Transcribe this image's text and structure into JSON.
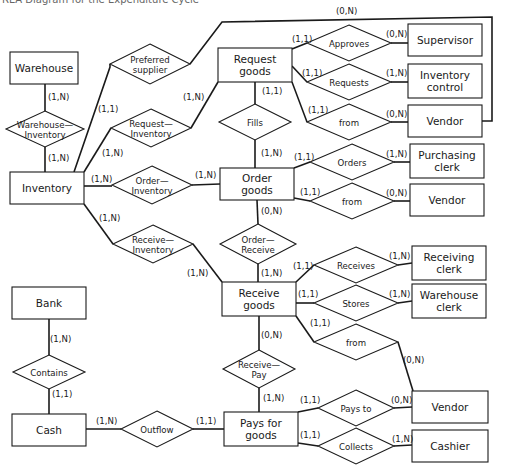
{
  "caption": "REA Diagram for the Expenditure Cycle",
  "colors": {
    "line": "#1a1a1a",
    "fill": "#ffffff",
    "background": "#ffffff"
  },
  "entities": [
    {
      "id": "warehouse",
      "label": [
        "Warehouse"
      ],
      "x": 10,
      "y": 52,
      "w": 68,
      "h": 32
    },
    {
      "id": "inventory",
      "label": [
        "Inventory"
      ],
      "x": 10,
      "y": 172,
      "w": 74,
      "h": 32
    },
    {
      "id": "request_goods",
      "label": [
        "Request",
        "goods"
      ],
      "x": 218,
      "y": 48,
      "w": 74,
      "h": 34
    },
    {
      "id": "supervisor",
      "label": [
        "Supervisor"
      ],
      "x": 408,
      "y": 24,
      "w": 74,
      "h": 32
    },
    {
      "id": "inventory_control",
      "label": [
        "Inventory",
        "control"
      ],
      "x": 408,
      "y": 64,
      "w": 74,
      "h": 34
    },
    {
      "id": "vendor_1",
      "label": [
        "Vendor"
      ],
      "x": 408,
      "y": 105,
      "w": 74,
      "h": 32
    },
    {
      "id": "order_goods",
      "label": [
        "Order",
        "goods"
      ],
      "x": 220,
      "y": 168,
      "w": 74,
      "h": 32
    },
    {
      "id": "purchasing_clerk",
      "label": [
        "Purchasing",
        "clerk"
      ],
      "x": 410,
      "y": 144,
      "w": 74,
      "h": 34
    },
    {
      "id": "vendor_2",
      "label": [
        "Vendor"
      ],
      "x": 410,
      "y": 184,
      "w": 74,
      "h": 32
    },
    {
      "id": "receive_goods",
      "label": [
        "Receive",
        "goods"
      ],
      "x": 222,
      "y": 282,
      "w": 74,
      "h": 34
    },
    {
      "id": "receiving_clerk",
      "label": [
        "Receiving",
        "clerk"
      ],
      "x": 412,
      "y": 246,
      "w": 74,
      "h": 34
    },
    {
      "id": "warehouse_clerk",
      "label": [
        "Warehouse",
        "clerk"
      ],
      "x": 412,
      "y": 284,
      "w": 74,
      "h": 34
    },
    {
      "id": "bank",
      "label": [
        "Bank"
      ],
      "x": 12,
      "y": 287,
      "w": 74,
      "h": 32
    },
    {
      "id": "cash",
      "label": [
        "Cash"
      ],
      "x": 12,
      "y": 414,
      "w": 74,
      "h": 32
    },
    {
      "id": "pays_for_goods",
      "label": [
        "Pays for",
        "goods"
      ],
      "x": 224,
      "y": 412,
      "w": 74,
      "h": 34
    },
    {
      "id": "vendor_3",
      "label": [
        "Vendor"
      ],
      "x": 412,
      "y": 391,
      "w": 76,
      "h": 32
    },
    {
      "id": "cashier",
      "label": [
        "Cashier"
      ],
      "x": 412,
      "y": 430,
      "w": 76,
      "h": 32
    }
  ],
  "relationships": [
    {
      "id": "preferred_supplier",
      "label": [
        "Preferred",
        "supplier"
      ],
      "cx": 150,
      "cy": 64,
      "hw": 40,
      "hh": 20
    },
    {
      "id": "warehouse_inventory",
      "label": [
        "Warehouse—",
        "Inventory"
      ],
      "cx": 45,
      "cy": 129,
      "hw": 39,
      "hh": 18
    },
    {
      "id": "request_inventory",
      "label": [
        "Request—",
        "Inventory"
      ],
      "cx": 151,
      "cy": 128,
      "hw": 40,
      "hh": 19
    },
    {
      "id": "approves",
      "label": [
        "Approves"
      ],
      "cx": 349,
      "cy": 43,
      "hw": 42,
      "hh": 18
    },
    {
      "id": "requests",
      "label": [
        "Requests"
      ],
      "cx": 349,
      "cy": 82,
      "hw": 42,
      "hh": 18
    },
    {
      "id": "from_1",
      "label": [
        "from"
      ],
      "cx": 349,
      "cy": 122,
      "hw": 42,
      "hh": 18
    },
    {
      "id": "fills",
      "label": [
        "Fills"
      ],
      "cx": 255,
      "cy": 122,
      "hw": 36,
      "hh": 18
    },
    {
      "id": "order_inventory",
      "label": [
        "Order—",
        "Inventory"
      ],
      "cx": 152,
      "cy": 185,
      "hw": 40,
      "hh": 19
    },
    {
      "id": "orders",
      "label": [
        "Orders"
      ],
      "cx": 352,
      "cy": 162,
      "hw": 42,
      "hh": 18
    },
    {
      "id": "from_2",
      "label": [
        "from"
      ],
      "cx": 352,
      "cy": 201,
      "hw": 42,
      "hh": 18
    },
    {
      "id": "order_receive",
      "label": [
        "Order—",
        "Receive"
      ],
      "cx": 258,
      "cy": 244,
      "hw": 38,
      "hh": 20
    },
    {
      "id": "receive_inventory",
      "label": [
        "Receive—",
        "Inventory"
      ],
      "cx": 153,
      "cy": 244,
      "hw": 40,
      "hh": 19
    },
    {
      "id": "receives",
      "label": [
        "Receives"
      ],
      "cx": 356,
      "cy": 265,
      "hw": 42,
      "hh": 18
    },
    {
      "id": "stores",
      "label": [
        "Stores"
      ],
      "cx": 356,
      "cy": 303,
      "hw": 42,
      "hh": 18
    },
    {
      "id": "from_3",
      "label": [
        "from"
      ],
      "cx": 356,
      "cy": 342,
      "hw": 42,
      "hh": 18
    },
    {
      "id": "contains",
      "label": [
        "Contains"
      ],
      "cx": 49,
      "cy": 372,
      "hw": 36,
      "hh": 17
    },
    {
      "id": "receive_pay",
      "label": [
        "Receive—",
        "Pay"
      ],
      "cx": 259,
      "cy": 369,
      "hw": 36,
      "hh": 19
    },
    {
      "id": "outflow",
      "label": [
        "Outflow"
      ],
      "cx": 157,
      "cy": 429,
      "hw": 36,
      "hh": 18
    },
    {
      "id": "pays_to",
      "label": [
        "Pays to"
      ],
      "cx": 356,
      "cy": 408,
      "hw": 38,
      "hh": 18
    },
    {
      "id": "collects",
      "label": [
        "Collects"
      ],
      "cx": 356,
      "cy": 446,
      "hw": 38,
      "hh": 18
    }
  ],
  "edges": [
    {
      "points": [
        [
          45,
          84
        ],
        [
          45,
          111
        ]
      ]
    },
    {
      "points": [
        [
          45,
          147
        ],
        [
          45,
          172
        ]
      ]
    },
    {
      "points": [
        [
          74,
          172
        ],
        [
          110,
          67
        ],
        [
          110,
          64
        ]
      ]
    },
    {
      "points": [
        [
          190,
          64
        ],
        [
          222,
          22
        ],
        [
          492,
          17
        ],
        [
          492,
          121
        ],
        [
          482,
          121
        ]
      ]
    },
    {
      "points": [
        [
          84,
          172
        ],
        [
          111,
          128
        ]
      ]
    },
    {
      "points": [
        [
          191,
          128
        ],
        [
          218,
          82
        ]
      ]
    },
    {
      "points": [
        [
          292,
          49
        ],
        [
          307,
          43
        ]
      ]
    },
    {
      "points": [
        [
          391,
          43
        ],
        [
          408,
          43
        ]
      ]
    },
    {
      "points": [
        [
          292,
          66
        ],
        [
          307,
          82
        ]
      ]
    },
    {
      "points": [
        [
          391,
          82
        ],
        [
          408,
          82
        ]
      ]
    },
    {
      "points": [
        [
          292,
          82
        ],
        [
          307,
          122
        ]
      ]
    },
    {
      "points": [
        [
          391,
          122
        ],
        [
          408,
          122
        ]
      ]
    },
    {
      "points": [
        [
          255,
          82
        ],
        [
          255,
          104
        ]
      ]
    },
    {
      "points": [
        [
          255,
          140
        ],
        [
          255,
          168
        ]
      ]
    },
    {
      "points": [
        [
          84,
          186
        ],
        [
          112,
          186
        ]
      ]
    },
    {
      "points": [
        [
          192,
          185
        ],
        [
          220,
          184
        ]
      ]
    },
    {
      "points": [
        [
          294,
          168
        ],
        [
          310,
          162
        ]
      ]
    },
    {
      "points": [
        [
          394,
          162
        ],
        [
          410,
          162
        ]
      ]
    },
    {
      "points": [
        [
          294,
          198
        ],
        [
          310,
          201
        ]
      ]
    },
    {
      "points": [
        [
          394,
          201
        ],
        [
          410,
          201
        ]
      ]
    },
    {
      "points": [
        [
          257,
          200
        ],
        [
          258,
          224
        ]
      ]
    },
    {
      "points": [
        [
          258,
          264
        ],
        [
          258,
          282
        ]
      ]
    },
    {
      "points": [
        [
          84,
          204
        ],
        [
          113,
          244
        ]
      ]
    },
    {
      "points": [
        [
          193,
          244
        ],
        [
          222,
          282
        ]
      ]
    },
    {
      "points": [
        [
          296,
          282
        ],
        [
          314,
          265
        ]
      ]
    },
    {
      "points": [
        [
          398,
          265
        ],
        [
          412,
          263
        ]
      ]
    },
    {
      "points": [
        [
          296,
          303
        ],
        [
          314,
          303
        ]
      ]
    },
    {
      "points": [
        [
          398,
          303
        ],
        [
          412,
          301
        ]
      ]
    },
    {
      "points": [
        [
          296,
          316
        ],
        [
          314,
          342
        ]
      ]
    },
    {
      "points": [
        [
          398,
          342
        ],
        [
          413,
          391
        ]
      ]
    },
    {
      "points": [
        [
          259,
          316
        ],
        [
          259,
          350
        ]
      ]
    },
    {
      "points": [
        [
          259,
          388
        ],
        [
          259,
          412
        ]
      ]
    },
    {
      "points": [
        [
          49,
          319
        ],
        [
          49,
          355
        ]
      ]
    },
    {
      "points": [
        [
          49,
          389
        ],
        [
          49,
          414
        ]
      ]
    },
    {
      "points": [
        [
          86,
          429
        ],
        [
          121,
          429
        ]
      ]
    },
    {
      "points": [
        [
          193,
          429
        ],
        [
          224,
          429
        ]
      ]
    },
    {
      "points": [
        [
          298,
          412
        ],
        [
          318,
          408
        ]
      ]
    },
    {
      "points": [
        [
          394,
          408
        ],
        [
          412,
          407
        ]
      ]
    },
    {
      "points": [
        [
          298,
          443
        ],
        [
          318,
          446
        ]
      ]
    },
    {
      "points": [
        [
          394,
          446
        ],
        [
          412,
          445
        ]
      ]
    }
  ],
  "cardinalities": [
    {
      "text": "(0,N)",
      "x": 336,
      "y": 14
    },
    {
      "text": "(1,N)",
      "x": 48,
      "y": 100
    },
    {
      "text": "(1,N)",
      "x": 48,
      "y": 161
    },
    {
      "text": "(1,1)",
      "x": 98,
      "y": 112
    },
    {
      "text": "(1,N)",
      "x": 183,
      "y": 100
    },
    {
      "text": "(1,N)",
      "x": 102,
      "y": 156
    },
    {
      "text": "(1,1)",
      "x": 292,
      "y": 42
    },
    {
      "text": "(0,N)",
      "x": 386,
      "y": 37
    },
    {
      "text": "(1,1)",
      "x": 302,
      "y": 76
    },
    {
      "text": "(1,N)",
      "x": 386,
      "y": 76
    },
    {
      "text": "(1,1)",
      "x": 262,
      "y": 94
    },
    {
      "text": "(1,1)",
      "x": 308,
      "y": 113
    },
    {
      "text": "(0,N)",
      "x": 386,
      "y": 117
    },
    {
      "text": "(1,N)",
      "x": 261,
      "y": 156
    },
    {
      "text": "(1,N)",
      "x": 91,
      "y": 182
    },
    {
      "text": "(1,N)",
      "x": 195,
      "y": 178
    },
    {
      "text": "(1,1)",
      "x": 294,
      "y": 160
    },
    {
      "text": "(1,N)",
      "x": 386,
      "y": 157
    },
    {
      "text": "(1,1)",
      "x": 300,
      "y": 195
    },
    {
      "text": "(0,N)",
      "x": 386,
      "y": 196
    },
    {
      "text": "(0,N)",
      "x": 261,
      "y": 214
    },
    {
      "text": "(1,N)",
      "x": 99,
      "y": 221
    },
    {
      "text": "(1,N)",
      "x": 187,
      "y": 276
    },
    {
      "text": "(1,N)",
      "x": 261,
      "y": 276
    },
    {
      "text": "(1,1)",
      "x": 293,
      "y": 269
    },
    {
      "text": "(1,N)",
      "x": 389,
      "y": 259
    },
    {
      "text": "(1,1)",
      "x": 298,
      "y": 297
    },
    {
      "text": "(1,N)",
      "x": 389,
      "y": 297
    },
    {
      "text": "(1,1)",
      "x": 310,
      "y": 326
    },
    {
      "text": "(0,N)",
      "x": 403,
      "y": 363
    },
    {
      "text": "(0,N)",
      "x": 261,
      "y": 338
    },
    {
      "text": "(1,N)",
      "x": 263,
      "y": 401
    },
    {
      "text": "(1,N)",
      "x": 50,
      "y": 342
    },
    {
      "text": "(1,1)",
      "x": 52,
      "y": 397
    },
    {
      "text": "(1,N)",
      "x": 96,
      "y": 424
    },
    {
      "text": "(1,1)",
      "x": 196,
      "y": 424
    },
    {
      "text": "(1,1)",
      "x": 300,
      "y": 403
    },
    {
      "text": "(0,N)",
      "x": 391,
      "y": 403
    },
    {
      "text": "(1,1)",
      "x": 300,
      "y": 438
    },
    {
      "text": "(1,N)",
      "x": 392,
      "y": 442
    }
  ]
}
